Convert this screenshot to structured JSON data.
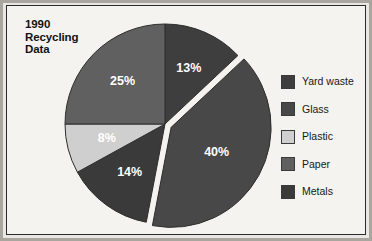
{
  "figure": {
    "title": "1990\nRecycling\nData",
    "background_color": "#f4f3f0",
    "border_color": "#2b2b2b"
  },
  "legend": {
    "position": "right",
    "items": [
      {
        "label": "Yard waste",
        "color": "#3e3e3e"
      },
      {
        "label": "Glass",
        "color": "#484848"
      },
      {
        "label": "Plastic",
        "color": "#cfcfcf"
      },
      {
        "label": "Paper",
        "color": "#606060"
      },
      {
        "label": "Metals",
        "color": "#3a3a3a"
      }
    ]
  },
  "chart_data": {
    "type": "pie",
    "title": "1990 Recycling Data",
    "xlabel": "",
    "ylabel": "",
    "grid": false,
    "legend_position": "right",
    "start_angle_deg": 90,
    "direction": "clockwise",
    "categories": [
      "Yard waste",
      "Glass",
      "Metals",
      "Plastic",
      "Paper"
    ],
    "values": [
      13,
      40,
      14,
      8,
      25
    ],
    "value_unit": "percent",
    "data_labels": [
      "13%",
      "40%",
      "14%",
      "8%",
      "25%"
    ],
    "colors": [
      "#3e3e3e",
      "#484848",
      "#3a3a3a",
      "#cfcfcf",
      "#606060"
    ],
    "exploded": [
      "Glass"
    ],
    "slices": [
      {
        "name": "Yard waste",
        "value": 13,
        "label": "13%",
        "color": "#3e3e3e",
        "exploded": false
      },
      {
        "name": "Glass",
        "value": 40,
        "label": "40%",
        "color": "#484848",
        "exploded": true
      },
      {
        "name": "Metals",
        "value": 14,
        "label": "14%",
        "color": "#3a3a3a",
        "exploded": false
      },
      {
        "name": "Plastic",
        "value": 8,
        "label": "8%",
        "color": "#cfcfcf",
        "exploded": false
      },
      {
        "name": "Paper",
        "value": 25,
        "label": "25%",
        "color": "#606060",
        "exploded": false
      }
    ]
  }
}
